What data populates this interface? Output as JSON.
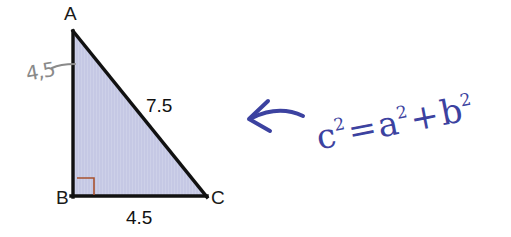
{
  "figure": {
    "type": "right-triangle-diagram",
    "background_color": "#ffffff",
    "fill_color": "#c5c8e4",
    "edge_color": "#111111",
    "right_angle_marker_color": "#a8522e",
    "vertices": [
      {
        "name": "A",
        "label": "A",
        "x": 73,
        "y": 32
      },
      {
        "name": "B",
        "label": "B",
        "x": 73,
        "y": 196
      },
      {
        "name": "C",
        "label": "C",
        "x": 206,
        "y": 196
      }
    ],
    "sides": [
      {
        "name": "hypotenuse",
        "from": "A",
        "to": "C",
        "label": "7.5"
      },
      {
        "name": "base",
        "from": "B",
        "to": "C",
        "label": "4.5"
      },
      {
        "name": "left-leg",
        "from": "A",
        "to": "B",
        "label": ""
      }
    ],
    "right_angle_at": "B"
  },
  "labels": {
    "vertex_a": "A",
    "vertex_b": "B",
    "vertex_c": "C",
    "hypotenuse": "7.5",
    "base": "4.5"
  },
  "annotations": {
    "pencil": {
      "leg_length": "4,5",
      "color": "#8a8a8a"
    },
    "ink": {
      "color": "#3c42a0",
      "arrow": "curved-left-arrow",
      "formula_text": "c² = a² + b²",
      "formula_parts": {
        "c": "c",
        "c_exp": "2",
        "equals": "=",
        "a": "a",
        "a_exp": "2",
        "plus": "+",
        "b": "b",
        "b_exp": "2"
      }
    }
  }
}
